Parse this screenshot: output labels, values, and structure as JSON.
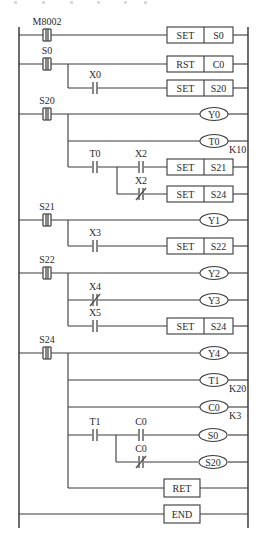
{
  "diagram": {
    "type": "PLC ladder diagram (step ladder / SFC)",
    "colors": {
      "line": "#3a3a3a",
      "text": "#2a2a2a",
      "background": "#ffffff"
    },
    "rails": {
      "left_x": 19,
      "right_x": 248,
      "top_y": 27,
      "bottom_y": 528
    },
    "step_contacts": [
      {
        "id": "M8002",
        "label": "M8002",
        "y": 35
      },
      {
        "id": "S0",
        "label": "S0",
        "y": 64
      },
      {
        "id": "S20",
        "label": "S20",
        "y": 114
      },
      {
        "id": "S21",
        "label": "S21",
        "y": 220
      },
      {
        "id": "S22",
        "label": "S22",
        "y": 273
      },
      {
        "id": "S24",
        "label": "S24",
        "y": 353
      }
    ],
    "contacts": [
      {
        "label": "X0",
        "type": "NO",
        "x": 95,
        "y": 88
      },
      {
        "label": "T0",
        "type": "NO",
        "x": 95,
        "y": 167
      },
      {
        "label": "X2",
        "type": "NO",
        "x": 141,
        "y": 167
      },
      {
        "label": "X2",
        "type": "NC",
        "x": 141,
        "y": 194
      },
      {
        "label": "X3",
        "type": "NO",
        "x": 95,
        "y": 246
      },
      {
        "label": "X4",
        "type": "NC",
        "x": 95,
        "y": 300
      },
      {
        "label": "X5",
        "type": "NO",
        "x": 95,
        "y": 326
      },
      {
        "label": "T1",
        "type": "NO",
        "x": 95,
        "y": 434
      },
      {
        "label": "C0",
        "type": "NO",
        "x": 141,
        "y": 434
      },
      {
        "label": "C0",
        "type": "NC",
        "x": 141,
        "y": 462
      }
    ],
    "instructions": [
      {
        "op": "SET",
        "operand": "S0",
        "y": 35
      },
      {
        "op": "RST",
        "operand": "C0",
        "y": 64
      },
      {
        "op": "SET",
        "operand": "S20",
        "y": 88
      },
      {
        "op": "SET",
        "operand": "S21",
        "y": 167
      },
      {
        "op": "SET",
        "operand": "S24",
        "y": 194
      },
      {
        "op": "SET",
        "operand": "S22",
        "y": 246
      },
      {
        "op": "SET",
        "operand": "S24",
        "y": 326
      }
    ],
    "coils": [
      {
        "label": "Y0",
        "y": 114,
        "preset": ""
      },
      {
        "label": "T0",
        "y": 141,
        "preset": "K10"
      },
      {
        "label": "Y1",
        "y": 220,
        "preset": ""
      },
      {
        "label": "Y2",
        "y": 273,
        "preset": ""
      },
      {
        "label": "Y3",
        "y": 300,
        "preset": ""
      },
      {
        "label": "Y4",
        "y": 353,
        "preset": ""
      },
      {
        "label": "T1",
        "y": 380,
        "preset": "K20"
      },
      {
        "label": "C0",
        "y": 407,
        "preset": "K3"
      },
      {
        "label": "S0",
        "y": 435,
        "preset": ""
      },
      {
        "label": "S20",
        "y": 462,
        "preset": ""
      }
    ],
    "single_instructions": [
      {
        "op": "RET",
        "y": 488
      },
      {
        "op": "END",
        "y": 514
      }
    ]
  }
}
